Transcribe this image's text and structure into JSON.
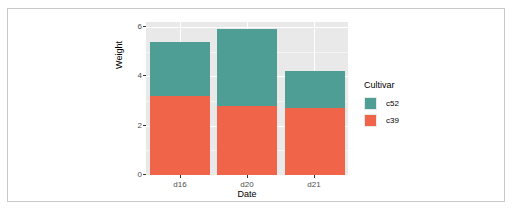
{
  "chart_data": {
    "type": "bar",
    "barmode": "stacked",
    "title": "",
    "subtitle": "",
    "xlabel": "Date",
    "ylabel": "Weight",
    "categories": [
      "d16",
      "d20",
      "d21"
    ],
    "series": [
      {
        "name": "c52",
        "color": "#4F9E96",
        "values": [
          2.2,
          3.1,
          1.5
        ]
      },
      {
        "name": "c39",
        "color": "#F0654A",
        "values": [
          3.2,
          2.8,
          2.7
        ]
      }
    ],
    "stack_order_top_to_bottom": [
      "c52",
      "c39"
    ],
    "totals": [
      5.4,
      5.9,
      4.2
    ],
    "ylim": [
      0,
      6.2
    ],
    "yticks": [
      0,
      2,
      4,
      6
    ],
    "ytick_labels": [
      "0",
      "2",
      "4",
      "6"
    ],
    "yminor_ticks": [
      1,
      3,
      5
    ],
    "grid": true,
    "legend": {
      "title": "Cultivar",
      "position": "right",
      "entries": [
        {
          "label": "c52",
          "color": "#4F9E96"
        },
        {
          "label": "c39",
          "color": "#F0654A"
        }
      ]
    },
    "panel_background": "#E9E9E9",
    "figure_background": "#FFFFFF"
  }
}
